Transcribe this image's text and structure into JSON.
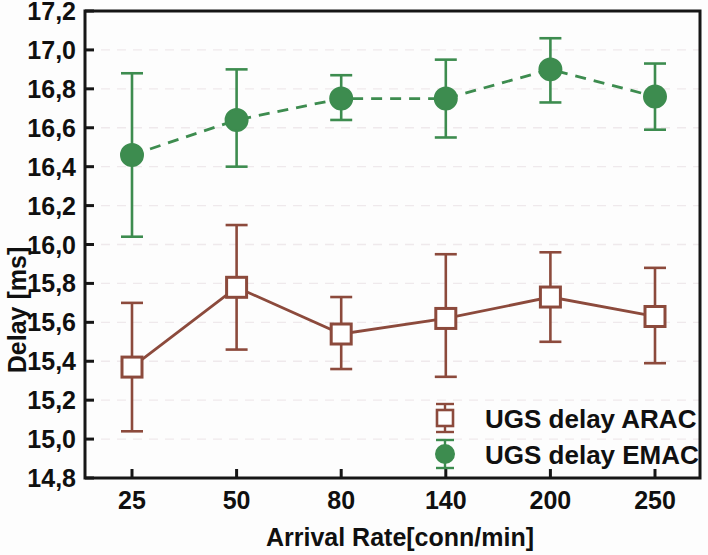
{
  "chart_data": {
    "type": "line",
    "title": "",
    "xlabel": "Arrival Rate[conn/min]",
    "ylabel": "Delay [ms]",
    "categories": [
      "25",
      "50",
      "80",
      "140",
      "200",
      "250"
    ],
    "ylim": [
      14.8,
      17.2
    ],
    "ytick_labels": [
      "14,8",
      "15,0",
      "15,2",
      "15,4",
      "15,6",
      "15,8",
      "16,0",
      "16,2",
      "16,4",
      "16,6",
      "16,8",
      "17,0",
      "17,2"
    ],
    "ytick_values": [
      14.8,
      15.0,
      15.2,
      15.4,
      15.6,
      15.8,
      16.0,
      16.2,
      16.4,
      16.6,
      16.8,
      17.0,
      17.2
    ],
    "grid": true,
    "legend_position": "bottom-right",
    "series": [
      {
        "name": "UGS delay ARAC",
        "color": "#8c4a3c",
        "marker": "open-square",
        "linestyle": "solid",
        "values": [
          15.37,
          15.78,
          15.54,
          15.62,
          15.73,
          15.63
        ],
        "error_low": [
          15.04,
          15.46,
          15.36,
          15.32,
          15.5,
          15.39
        ],
        "error_high": [
          15.7,
          16.1,
          15.73,
          15.95,
          15.96,
          15.88
        ]
      },
      {
        "name": "UGS delay EMAC",
        "color": "#3d8c4f",
        "marker": "filled-circle",
        "linestyle": "dashed",
        "values": [
          16.46,
          16.64,
          16.75,
          16.75,
          16.9,
          16.76
        ],
        "error_low": [
          16.04,
          16.4,
          16.64,
          16.55,
          16.73,
          16.59
        ],
        "error_high": [
          16.88,
          16.9,
          16.87,
          16.95,
          17.06,
          16.93
        ]
      }
    ]
  },
  "legend": {
    "entries": [
      {
        "label": "UGS delay ARAC"
      },
      {
        "label": "UGS delay EMAC"
      }
    ]
  }
}
